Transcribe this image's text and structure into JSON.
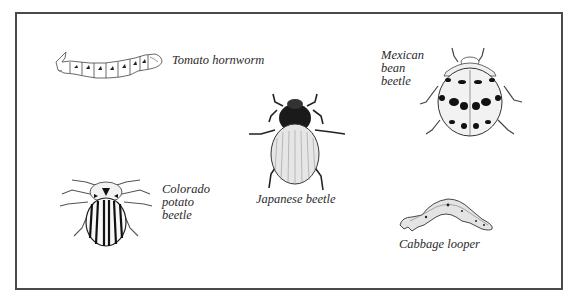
{
  "figure": {
    "type": "illustration-plate",
    "border_color": "#4a4a4a",
    "insects": [
      {
        "id": "tomato-hornworm",
        "label_lines": [
          "Tomato hornworm"
        ]
      },
      {
        "id": "japanese-beetle",
        "label_lines": [
          "Japanese beetle"
        ]
      },
      {
        "id": "mexican-bean-beetle",
        "label_lines": [
          "Mexican",
          "bean",
          "beetle"
        ]
      },
      {
        "id": "colorado-potato-beetle",
        "label_lines": [
          "Colorado",
          "potato",
          "beetle"
        ]
      },
      {
        "id": "cabbage-looper",
        "label_lines": [
          "Cabbage looper"
        ]
      }
    ]
  }
}
